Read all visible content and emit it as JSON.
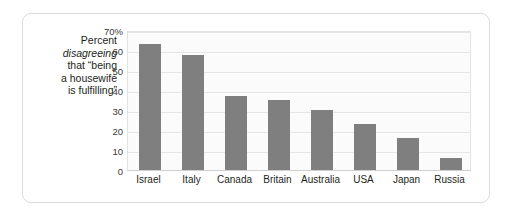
{
  "caption": {
    "lines": [
      {
        "text": "Percent",
        "italic": false
      },
      {
        "text": "disagreeing",
        "italic": true
      },
      {
        "text": "that “being",
        "italic": false
      },
      {
        "text": "a housewife",
        "italic": false
      },
      {
        "text": "is fulfilling”",
        "italic": false
      }
    ]
  },
  "colors": {
    "bar": "#7f7f7f",
    "plot_background": "#fbfbfb",
    "gridline": "#e6e6e6",
    "frame_border": "#dcdcdc",
    "text": "#231f20"
  },
  "chart_data": {
    "type": "bar",
    "title": "",
    "xlabel": "",
    "ylabel": "Percent disagreeing that “being a housewife is fulfilling”",
    "categories": [
      "Israel",
      "Italy",
      "Canada",
      "Britain",
      "Australia",
      "USA",
      "Japan",
      "Russia"
    ],
    "values": [
      63,
      57.5,
      37,
      35,
      30,
      23,
      16,
      6
    ],
    "ylim": [
      0,
      70
    ],
    "ytick_values": [
      70,
      60,
      50,
      40,
      30,
      20,
      10,
      0
    ],
    "ytick_labels": [
      "70%",
      "60",
      "50",
      "40",
      "30",
      "20",
      "10",
      "0"
    ],
    "grid": true,
    "legend": null,
    "legend_position": "none",
    "orientation": "vertical"
  }
}
